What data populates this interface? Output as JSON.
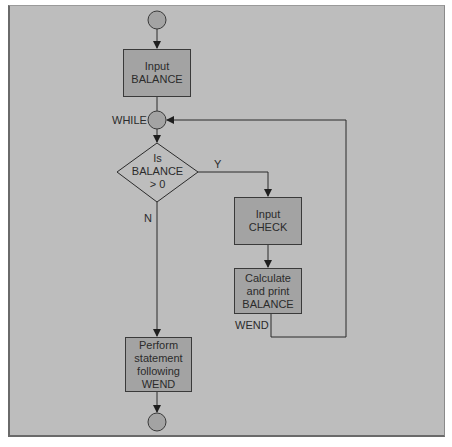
{
  "flowchart": {
    "nodes": {
      "start": {
        "type": "terminal-circle"
      },
      "input_balance": {
        "type": "process",
        "label": "Input\nBALANCE"
      },
      "while_node": {
        "type": "connector-circle",
        "label": "WHILE"
      },
      "decision": {
        "type": "decision",
        "label": "Is\nBALANCE\n> 0"
      },
      "input_check": {
        "type": "process",
        "label": "Input\nCHECK"
      },
      "calc_print": {
        "type": "process",
        "label": "Calculate\nand print\nBALANCE"
      },
      "perform": {
        "type": "process",
        "label": "Perform\nstatement\nfollowing\nWEND"
      },
      "end": {
        "type": "terminal-circle"
      }
    },
    "edge_labels": {
      "yes": "Y",
      "no": "N",
      "wend": "WEND"
    },
    "colors": {
      "background": "#bdbdbd",
      "box_fill": "#a3a3a3",
      "circle_fill": "#a3a3a3",
      "line": "#2b2b2b"
    }
  }
}
